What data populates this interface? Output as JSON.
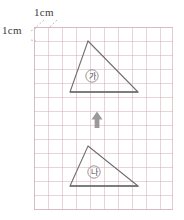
{
  "diagram": {
    "grid": {
      "cell_label_top": "1cm",
      "cell_label_left": "1cm",
      "cell_size_px": 14,
      "cols": 10,
      "rows": 13,
      "line_color": "#d6b2ba",
      "border_color": "#d0aab2"
    },
    "shapes": [
      {
        "name": "triangle-ga",
        "label": "가",
        "label_shape": "circle",
        "apex": [
          88,
          41
        ],
        "base_left": [
          70,
          92
        ],
        "base_right": [
          138,
          92
        ],
        "stroke": "#6f6f6f"
      },
      {
        "name": "triangle-na",
        "label": "나",
        "label_shape": "circle",
        "apex": [
          88,
          146
        ],
        "base_left": [
          70,
          186
        ],
        "base_right": [
          138,
          186
        ],
        "stroke": "#6f6f6f"
      }
    ],
    "arrow": {
      "name": "up-arrow",
      "direction": "up",
      "color": "#9a9a9a",
      "x": 97,
      "y_top": 112,
      "y_bottom": 128
    }
  }
}
